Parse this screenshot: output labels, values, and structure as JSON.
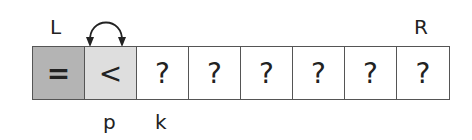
{
  "pointers": {
    "left": "L",
    "right": "R",
    "p": "p",
    "k": "k"
  },
  "cells": [
    {
      "symbol": "=",
      "color": "#b4b4b4"
    },
    {
      "symbol": "<",
      "color": "#dedede"
    },
    {
      "symbol": "?",
      "color": "#ffffff"
    },
    {
      "symbol": "?",
      "color": "#ffffff"
    },
    {
      "symbol": "?",
      "color": "#ffffff"
    },
    {
      "symbol": "?",
      "color": "#ffffff"
    },
    {
      "symbol": "?",
      "color": "#ffffff"
    },
    {
      "symbol": "?",
      "color": "#ffffff"
    }
  ],
  "arrow": {
    "type": "swap-arrow",
    "between": [
      "L",
      "p"
    ]
  }
}
